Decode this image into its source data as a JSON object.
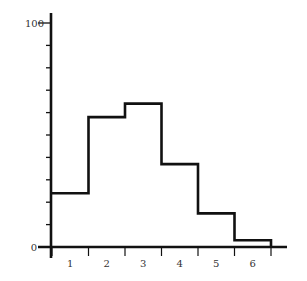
{
  "chart_data": {
    "type": "bar",
    "subtype": "histogram-step",
    "title": "",
    "xlabel": "",
    "ylabel": "",
    "categories": [
      "1",
      "2",
      "3",
      "4",
      "5",
      "6"
    ],
    "values": [
      24,
      58,
      64,
      37,
      15,
      3
    ],
    "ylim": [
      0,
      100
    ],
    "y_tick_labels": [
      "0",
      "100"
    ],
    "y_minor_ticks": [
      0,
      10,
      20,
      30,
      40,
      50,
      60,
      70,
      80,
      90,
      100
    ],
    "x_tick_labels": [
      "1",
      "2",
      "3",
      "4",
      "5",
      "6"
    ],
    "grid": false,
    "legend": null,
    "colors": {
      "line": "#111111",
      "text": "#333333",
      "background": "#ffffff"
    }
  }
}
